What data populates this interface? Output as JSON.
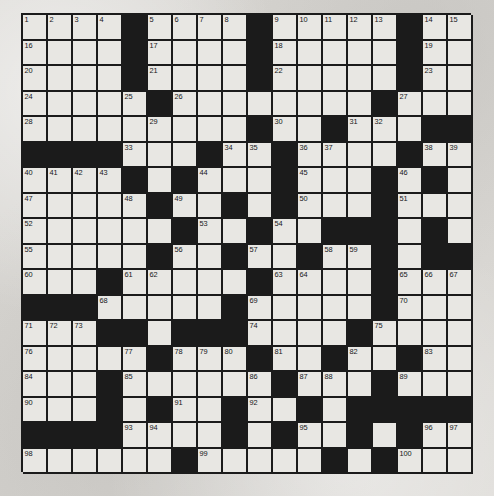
{
  "puzzle": {
    "title": "Crossword Puzzle Grid",
    "type": "crossword",
    "rows": 18,
    "cols": 18,
    "colors": {
      "background": "#d8d6d2",
      "cell_fill": "#e8e7e3",
      "block_fill": "#1b1b1b",
      "grid_line": "#1b1b1b",
      "number_text": "#16161a"
    },
    "total_clue_numbers": 123,
    "grid": [
      {
        "row": 0,
        "blocks": [
          4,
          9,
          15
        ],
        "numbers": {
          "0": "1",
          "1": "2",
          "2": "3",
          "3": "4",
          "5": "5",
          "6": "6",
          "7": "7",
          "8": "8",
          "10": "9",
          "11": "10",
          "12": "11",
          "13": "12",
          "14": "13",
          "16": "14",
          "17": "15"
        }
      },
      {
        "row": 1,
        "blocks": [
          4,
          9,
          15
        ],
        "numbers": {
          "0": "19",
          "5": "20",
          "10": "21",
          "16": "22"
        }
      },
      {
        "row": 2,
        "blocks": [
          4,
          9,
          15
        ],
        "numbers": {
          "0": "23",
          "5": "24",
          "10": "25",
          "16": "26"
        }
      },
      {
        "row": 3,
        "blocks": [
          13
        ],
        "numbers": {
          "0": "27",
          "5": "28",
          "10": "29",
          "14": "30",
          "15": "31"
        }
      },
      {
        "row": 4,
        "blocks": [
          8,
          12,
          16,
          17
        ],
        "numbers": {
          "0": "32",
          "9": "33",
          "13": "34"
        }
      },
      {
        "row": 5,
        "blocks": [
          0,
          1,
          2,
          3,
          10,
          15
        ],
        "numbers": {
          "4": "35",
          "7": "36",
          "11": "37",
          "12": "38",
          "16": "39"
        }
      },
      {
        "row": 6,
        "blocks": [
          5,
          9,
          15
        ],
        "numbers": {
          "0": "43",
          "1": "44",
          "2": "45",
          "3": "46",
          "6": "47",
          "10": "48",
          "14": "49",
          "16": "50"
        }
      },
      {
        "row": 7,
        "blocks": [
          10,
          14
        ],
        "numbers": {
          "0": "51",
          "5": "52",
          "8": "53",
          "15": "54"
        }
      },
      {
        "row": 8,
        "blocks": [
          5,
          12,
          13,
          14
        ],
        "numbers": {
          "0": "55",
          "6": "56",
          "7": "57",
          "15": "58"
        }
      },
      {
        "row": 9,
        "blocks": [
          4,
          11,
          15,
          16,
          17
        ],
        "numbers": {
          "0": "59",
          "5": "60",
          "6": "61",
          "12": "62",
          "13": "63",
          "14": "64"
        }
      },
      {
        "row": 10,
        "blocks": [
          3,
          13
        ],
        "numbers": {
          "0": "65",
          "4": "66",
          "9": "67",
          "10": "68",
          "15": "69",
          "16": "70",
          "17": "71"
        }
      },
      {
        "row": 11,
        "blocks": [
          0,
          1,
          2,
          8,
          14
        ],
        "numbers": {
          "3": "72",
          "9": "73",
          "15": "74"
        }
      },
      {
        "row": 12,
        "blocks": [
          5,
          6,
          7,
          13
        ],
        "numbers": {
          "0": "75",
          "1": "76",
          "2": "77",
          "8": "78",
          "9": "79",
          "14": "80",
          "15": "81"
        }
      },
      {
        "row": 13,
        "blocks": [
          11
        ],
        "numbers": {
          "0": "82",
          "5": "83",
          "6": "84",
          "7": "85",
          "12": "86",
          "13": "87"
        }
      },
      {
        "row": 14,
        "blocks": [
          3,
          10,
          14
        ],
        "numbers": {
          "0": "88",
          "4": "89",
          "11": "90",
          "15": "91"
        }
      },
      {
        "row": 15,
        "blocks": [
          4,
          8,
          13,
          14,
          15,
          16,
          17
        ],
        "numbers": {
          "0": "92",
          "3": "93",
          "5": "94",
          "9": "95",
          "12": "96"
        }
      },
      {
        "row": 16,
        "blocks": [
          0,
          1,
          2,
          3,
          9,
          13
        ],
        "numbers": {
          "4": "97",
          "5": "98",
          "8": "99",
          "10": "100",
          "14": "101",
          "16": "102",
          "17": "103"
        }
      },
      {
        "row": 17,
        "blocks": [],
        "numbers": {
          "0": "111",
          "7": "112",
          "8": "113"
        }
      }
    ]
  }
}
